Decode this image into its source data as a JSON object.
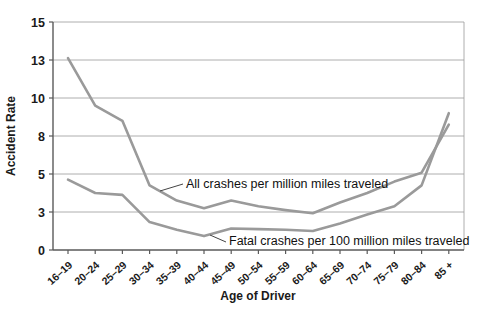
{
  "figure": {
    "background": "#ffffff"
  },
  "chart_data": {
    "type": "line",
    "title": "",
    "xlabel": "Age of Driver",
    "ylabel": "Accident Rate",
    "categories": [
      "16–19",
      "20–24",
      "25–29",
      "30–34",
      "35–39",
      "40–44",
      "45–49",
      "50–54",
      "55–59",
      "60–64",
      "65–69",
      "70–74",
      "75–79",
      "80–84",
      "85 +"
    ],
    "series": [
      {
        "name": "All crashes per million miles traveled",
        "values": [
          13.1,
          9.6,
          8.8,
          4.4,
          3.6,
          3.2,
          3.6,
          3.3,
          3.1,
          2.9,
          3.5,
          4.0,
          4.6,
          5.1,
          8.6
        ]
      },
      {
        "name": "Fatal crashes per 100 million miles traveled",
        "values": [
          4.7,
          4.0,
          3.9,
          2.2,
          1.6,
          1.1,
          1.7,
          1.65,
          1.6,
          1.5,
          2.1,
          2.8,
          3.3,
          4.4,
          9.2
        ]
      }
    ],
    "y_ticks": [
      0,
      3,
      5,
      8,
      10,
      13,
      15
    ],
    "y_tick_labels_top_to_bottom": [
      "15",
      "13",
      "10",
      "8",
      "5",
      "3",
      "0"
    ],
    "y_scale_note": "tick values are evenly spaced on the axis (non-linear scale)",
    "ylim": [
      0,
      15
    ],
    "grid": "horizontal gridlines at every y tick, full plot border",
    "legend_position": "inline annotations with leader lines",
    "colors": {
      "line": "#9a9a9a",
      "grid": "#999999",
      "spine": "#5a5a5a",
      "text": "#1a1a1a"
    }
  }
}
